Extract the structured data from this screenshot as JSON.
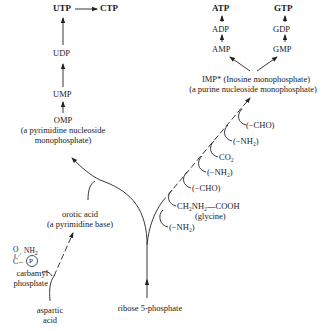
{
  "pyrimidine_branch": {
    "utp": "UTP",
    "ctp": "CTP",
    "udp": "UDP",
    "ump": "UMP",
    "omp": "OMP",
    "omp_desc_1": "(a pyrimidine nucleoside",
    "omp_desc_2": "monophosphate)",
    "orotic": "orotic acid",
    "orotic_desc": "(a pyrimidine base)",
    "carbamyl_1": "carbamyl",
    "carbamyl_2": "phosphate",
    "carbamyl_struct": {
      "o": "O",
      "c": "C",
      "nh": "NH",
      "nh_sub": "2",
      "p": "P"
    },
    "aspartic_1": "aspartic",
    "aspartic_2": "acid"
  },
  "purine_branch": {
    "atp": "ATP",
    "adp": "ADP",
    "amp": "AMP",
    "gtp": "GTP",
    "gdp": "GDP",
    "gmp": "GMP",
    "imp_1": "IMP* (Inosine monophosphate)",
    "imp_2": "(a purine nucleoside monophosphate)",
    "additions": [
      "(−CHO)",
      "(−NH₂)",
      "CO₂",
      "(−NH₂)",
      "(−CHO)",
      "CH₂NH₂—COOH",
      "(glycine)",
      "(−NH₂)"
    ]
  },
  "ribose": "ribose 5-phosphate"
}
